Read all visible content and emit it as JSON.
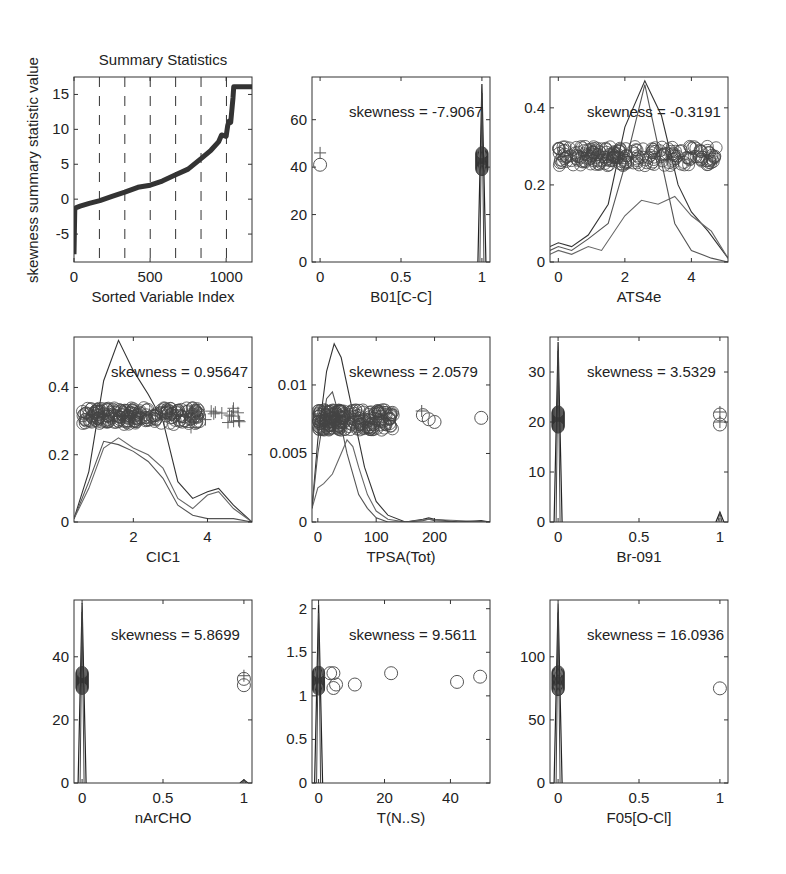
{
  "figure": {
    "ylabel_global": "skewness summary statistic value"
  },
  "chart_data": [
    {
      "id": "summary",
      "type": "line",
      "title": "Summary Statistics",
      "xlabel": "Sorted Variable Index",
      "ylabel": "skewness summary statistic value",
      "xlim": [
        0,
        1170
      ],
      "ylim": [
        -9,
        17.5
      ],
      "xticks": [
        0,
        500,
        1000
      ],
      "yticks": [
        -5,
        0,
        5,
        10,
        15
      ],
      "grid": "vertical dashed lines at panel sample positions",
      "dashed_x": [
        167,
        334,
        501,
        668,
        835,
        1002
      ],
      "x": [
        0,
        5,
        15,
        40,
        100,
        170,
        250,
        334,
        420,
        501,
        580,
        668,
        750,
        835,
        900,
        950,
        970,
        1000,
        1010,
        1020,
        1030,
        1045,
        1050,
        1100,
        1170
      ],
      "y": [
        -7.9,
        -1.5,
        -1.2,
        -1.0,
        -0.6,
        -0.2,
        0.4,
        1.0,
        1.7,
        2.0,
        2.6,
        3.5,
        4.3,
        5.8,
        7.0,
        8.2,
        9.2,
        9.0,
        10.5,
        11.2,
        11.0,
        14.5,
        16.1,
        16.1,
        16.1
      ]
    },
    {
      "id": "B01CC",
      "type": "density+scatter",
      "xlabel": "B01[C-C]",
      "skewness_label": "skewness = -7.9067",
      "xlim": [
        -0.05,
        1.05
      ],
      "ylim": [
        0,
        78
      ],
      "xticks": [
        0,
        0.5,
        1
      ],
      "ytick_labels": [
        "0",
        "20",
        "40",
        "60"
      ],
      "yticks": [
        0,
        20,
        40,
        60
      ],
      "spikes": [
        {
          "x": 1.0,
          "height": 75
        }
      ],
      "circles_cluster": [
        {
          "x": 1.0,
          "y_min": 39,
          "y_max": 46
        }
      ],
      "circles": [
        {
          "x": 0.0,
          "y": 41
        }
      ],
      "pluses": [
        {
          "x": 0.0,
          "y": 46
        }
      ]
    },
    {
      "id": "ATS4e",
      "type": "density+scatter",
      "xlabel": "ATS4e",
      "skewness_label": "skewness = -0.3191",
      "xlim": [
        -0.25,
        5.1
      ],
      "ylim": [
        0,
        0.48
      ],
      "xticks": [
        0,
        2,
        4
      ],
      "ytick_labels": [
        "0",
        "0.2",
        "0.4"
      ],
      "yticks": [
        0,
        0.2,
        0.4
      ],
      "scatter_band": {
        "x_min": 0,
        "x_max": 4.8,
        "y_min": 0.25,
        "y_max": 0.3
      },
      "series": [
        {
          "name": "density-1",
          "x": [
            -0.25,
            0,
            0.4,
            0.9,
            1.5,
            2.0,
            2.6,
            3.1,
            3.6,
            4.0,
            4.5,
            5.1
          ],
          "y": [
            0.04,
            0.05,
            0.04,
            0.07,
            0.15,
            0.35,
            0.47,
            0.38,
            0.2,
            0.13,
            0.08,
            0.01
          ]
        },
        {
          "name": "density-2",
          "x": [
            -0.25,
            0,
            0.4,
            0.9,
            1.5,
            2.0,
            2.6,
            3.0,
            3.5,
            4.0,
            4.6,
            5.1
          ],
          "y": [
            0.03,
            0.04,
            0.03,
            0.06,
            0.1,
            0.25,
            0.46,
            0.3,
            0.1,
            0.03,
            0.01,
            0.0
          ]
        },
        {
          "name": "density-3",
          "x": [
            -0.25,
            0,
            0.4,
            0.9,
            1.3,
            2.0,
            2.5,
            3.0,
            3.5,
            4.0,
            4.6,
            5.1
          ],
          "y": [
            0.02,
            0.03,
            0.02,
            0.04,
            0.03,
            0.12,
            0.16,
            0.15,
            0.17,
            0.12,
            0.08,
            0.01
          ]
        }
      ]
    },
    {
      "id": "CIC1",
      "type": "density+scatter",
      "xlabel": "CIC1",
      "skewness_label": "skewness = 0.95647",
      "xlim": [
        0.4,
        5.2
      ],
      "ylim": [
        0,
        0.55
      ],
      "xticks": [
        2,
        4
      ],
      "ytick_labels": [
        "0",
        "0.2",
        "0.4"
      ],
      "yticks": [
        0,
        0.2,
        0.4
      ],
      "scatter_band": {
        "x_min": 0.6,
        "x_max": 3.8,
        "y_min": 0.29,
        "y_max": 0.34
      },
      "pluses_band": {
        "x_min": 3.5,
        "x_max": 4.9,
        "y_min": 0.28,
        "y_max": 0.34
      },
      "series": [
        {
          "name": "density-1",
          "x": [
            0.4,
            0.8,
            1.2,
            1.6,
            2.0,
            2.4,
            2.8,
            3.2,
            3.6,
            4.0,
            4.3,
            4.7,
            5.2
          ],
          "y": [
            0.01,
            0.15,
            0.42,
            0.54,
            0.45,
            0.38,
            0.3,
            0.12,
            0.07,
            0.09,
            0.1,
            0.05,
            0.0
          ]
        },
        {
          "name": "density-2",
          "x": [
            0.4,
            0.8,
            1.2,
            1.6,
            2.0,
            2.4,
            2.8,
            3.2,
            3.6,
            4.0,
            4.3,
            4.7,
            5.2
          ],
          "y": [
            0.01,
            0.12,
            0.24,
            0.23,
            0.21,
            0.18,
            0.13,
            0.05,
            0.02,
            0.01,
            0.01,
            0.01,
            0.0
          ]
        },
        {
          "name": "density-3",
          "x": [
            0.4,
            0.8,
            1.2,
            1.6,
            2.0,
            2.4,
            2.8,
            3.2,
            3.6,
            4.0,
            4.3,
            4.7,
            5.2
          ],
          "y": [
            0.01,
            0.1,
            0.22,
            0.25,
            0.22,
            0.2,
            0.16,
            0.07,
            0.04,
            0.08,
            0.09,
            0.04,
            0.0
          ]
        }
      ]
    },
    {
      "id": "TPSA",
      "type": "density+scatter",
      "xlabel": "TPSA(Tot)",
      "skewness_label": "skewness = 2.0579",
      "xlim": [
        -10,
        295
      ],
      "ylim": [
        0,
        0.0135
      ],
      "xticks": [
        0,
        100,
        200
      ],
      "ytick_labels": [
        "0",
        "0.005",
        "0.01"
      ],
      "yticks": [
        0,
        0.005,
        0.01
      ],
      "scatter_band": {
        "x_min": 0,
        "x_max": 130,
        "y_min": 0.0067,
        "y_max": 0.0082
      },
      "circles": [
        {
          "x": 180,
          "y": 0.0078
        },
        {
          "x": 190,
          "y": 0.0075
        },
        {
          "x": 200,
          "y": 0.0073
        },
        {
          "x": 280,
          "y": 0.0076
        }
      ],
      "pluses": [
        {
          "x": 178,
          "y": 0.0081
        }
      ],
      "series": [
        {
          "name": "density-1",
          "x": [
            -10,
            0,
            15,
            28,
            40,
            60,
            80,
            100,
            120,
            150,
            180,
            190,
            200,
            240,
            280,
            295
          ],
          "y": [
            0.001,
            0.006,
            0.011,
            0.013,
            0.012,
            0.008,
            0.004,
            0.0015,
            0.0005,
            0.0,
            0.0002,
            0.0003,
            0.0002,
            0.0,
            0.0001,
            0.0
          ]
        },
        {
          "name": "density-2",
          "x": [
            -10,
            0,
            15,
            25,
            35,
            50,
            70,
            85,
            100,
            120,
            150,
            180,
            190,
            200,
            240,
            295
          ],
          "y": [
            0.001,
            0.005,
            0.009,
            0.0095,
            0.008,
            0.005,
            0.002,
            0.001,
            0.0003,
            0.0,
            0.0,
            0.0001,
            0.0002,
            0.0001,
            0.0,
            0.0
          ]
        },
        {
          "name": "density-3",
          "x": [
            -10,
            0,
            10,
            25,
            40,
            50,
            60,
            70,
            85,
            100,
            120,
            150,
            190,
            295
          ],
          "y": [
            0.001,
            0.0025,
            0.0028,
            0.0035,
            0.005,
            0.006,
            0.0055,
            0.004,
            0.002,
            0.0008,
            0.0002,
            0.0,
            0.0002,
            0.0
          ]
        }
      ]
    },
    {
      "id": "Br091",
      "type": "density+scatter",
      "xlabel": "Br-091",
      "skewness_label": "skewness = 3.5329",
      "xlim": [
        -0.05,
        1.05
      ],
      "ylim": [
        0,
        37
      ],
      "xticks": [
        0,
        0.5,
        1
      ],
      "ytick_labels": [
        "0",
        "10",
        "20",
        "30"
      ],
      "yticks": [
        0,
        10,
        20,
        30
      ],
      "spikes": [
        {
          "x": 0.0,
          "height": 36
        },
        {
          "x": 1.0,
          "height": 2
        }
      ],
      "circles_cluster": [
        {
          "x": 0.0,
          "y_min": 19,
          "y_max": 22
        }
      ],
      "circles": [
        {
          "x": 1.0,
          "y": 21.5
        },
        {
          "x": 1.0,
          "y": 19.5
        }
      ],
      "pluses": [
        {
          "x": 1.0,
          "y": 22
        },
        {
          "x": 1.0,
          "y": 20
        }
      ]
    },
    {
      "id": "nArCHO",
      "type": "density+scatter",
      "xlabel": "nArCHO",
      "skewness_label": "skewness = 5.8699",
      "xlim": [
        -0.05,
        1.05
      ],
      "ylim": [
        0,
        58
      ],
      "xticks": [
        0,
        0.5,
        1
      ],
      "ytick_labels": [
        "0",
        "20",
        "40"
      ],
      "yticks": [
        0,
        20,
        40
      ],
      "spikes": [
        {
          "x": 0.0,
          "height": 57
        },
        {
          "x": 1.0,
          "height": 1
        }
      ],
      "circles_cluster": [
        {
          "x": 0.0,
          "y_min": 30,
          "y_max": 35
        }
      ],
      "circles": [
        {
          "x": 1.0,
          "y": 33
        },
        {
          "x": 1.0,
          "y": 31
        }
      ],
      "pluses": [
        {
          "x": 1.0,
          "y": 34
        }
      ]
    },
    {
      "id": "TNS",
      "type": "density+scatter",
      "xlabel": "T(N..S)",
      "skewness_label": "skewness = 9.5611",
      "xlim": [
        -2,
        52
      ],
      "ylim": [
        0,
        2.1
      ],
      "xticks": [
        0,
        20,
        40
      ],
      "ytick_labels": [
        "0",
        "0.5",
        "1",
        "1.5",
        "2"
      ],
      "yticks": [
        0,
        0.5,
        1,
        1.5,
        2
      ],
      "spikes": [
        {
          "x": 0.0,
          "height": 2.05
        }
      ],
      "circles_cluster": [
        {
          "x": 0.0,
          "y_min": 1.08,
          "y_max": 1.27
        }
      ],
      "circles": [
        {
          "x": 3.5,
          "y": 1.26
        },
        {
          "x": 4.5,
          "y": 1.26
        },
        {
          "x": 4.5,
          "y": 1.09
        },
        {
          "x": 5.3,
          "y": 1.13
        },
        {
          "x": 11,
          "y": 1.13
        },
        {
          "x": 22,
          "y": 1.26
        },
        {
          "x": 42,
          "y": 1.16
        },
        {
          "x": 49,
          "y": 1.22
        }
      ]
    },
    {
      "id": "F05OCl",
      "type": "density+scatter",
      "xlabel": "F05[O-Cl]",
      "skewness_label": "skewness = 16.0936",
      "xlim": [
        -0.05,
        1.05
      ],
      "ylim": [
        0,
        145
      ],
      "xticks": [
        0,
        0.5,
        1
      ],
      "ytick_labels": [
        "0",
        "50",
        "100"
      ],
      "yticks": [
        0,
        50,
        100
      ],
      "spikes": [
        {
          "x": 0.0,
          "height": 142
        }
      ],
      "circles_cluster": [
        {
          "x": 0.0,
          "y_min": 74,
          "y_max": 88
        }
      ],
      "circles": [
        {
          "x": 1.0,
          "y": 75
        }
      ]
    }
  ]
}
